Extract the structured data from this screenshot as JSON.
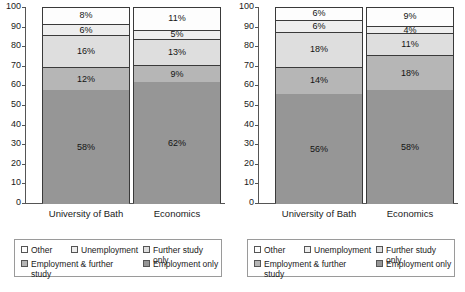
{
  "chart_data": [
    {
      "type": "bar",
      "subtype": "stacked-100-percent",
      "title": "",
      "xlabel": "",
      "ylabel": "",
      "ylim": [
        0,
        100
      ],
      "yticks": [
        0,
        10,
        20,
        30,
        40,
        50,
        60,
        70,
        80,
        90,
        100
      ],
      "grid": false,
      "legend_position": "bottom",
      "categories": [
        "University of Bath",
        "Economics"
      ],
      "series": [
        {
          "name": "Employment only",
          "values": [
            58,
            62
          ],
          "color": "#969696"
        },
        {
          "name": "Employment & further study",
          "values": [
            12,
            9
          ],
          "color": "#b6b6b6"
        },
        {
          "name": "Further study only",
          "values": [
            16,
            13
          ],
          "color": "#dedede"
        },
        {
          "name": "Unemployment",
          "values": [
            6,
            5
          ],
          "color": "#eeeeee"
        },
        {
          "name": "Other",
          "values": [
            8,
            11
          ],
          "color": "#fdfdfd"
        }
      ],
      "data_labels": [
        [
          "58%",
          "12%",
          "16%",
          "6%",
          "8%"
        ],
        [
          "62%",
          "9%",
          "13%",
          "5%",
          "11%"
        ]
      ]
    },
    {
      "type": "bar",
      "subtype": "stacked-100-percent",
      "title": "",
      "xlabel": "",
      "ylabel": "",
      "ylim": [
        0,
        100
      ],
      "yticks": [
        0,
        10,
        20,
        30,
        40,
        50,
        60,
        70,
        80,
        90,
        100
      ],
      "grid": false,
      "legend_position": "bottom",
      "categories": [
        "University of Bath",
        "Economics"
      ],
      "series": [
        {
          "name": "Employment only",
          "values": [
            56,
            58
          ],
          "color": "#969696"
        },
        {
          "name": "Employment & further study",
          "values": [
            14,
            18
          ],
          "color": "#b6b6b6"
        },
        {
          "name": "Further study only",
          "values": [
            18,
            11
          ],
          "color": "#dedede"
        },
        {
          "name": "Unemployment",
          "values": [
            6,
            4
          ],
          "color": "#eeeeee"
        },
        {
          "name": "Other",
          "values": [
            6,
            9
          ],
          "color": "#fdfdfd"
        }
      ],
      "data_labels": [
        [
          "56%",
          "14%",
          "18%",
          "6%",
          "6%"
        ],
        [
          "58%",
          "18%",
          "11%",
          "4%",
          "9%"
        ]
      ]
    }
  ],
  "panels": [
    {
      "id": "left-chart",
      "yticks": [
        "100",
        "90",
        "80",
        "70",
        "60",
        "50",
        "40",
        "30",
        "20",
        "10",
        "0"
      ],
      "bars": [
        {
          "label": "University of Bath",
          "segments": [
            {
              "key": "other",
              "label": "8%",
              "value": 8
            },
            {
              "key": "unemployment",
              "label": "6%",
              "value": 6
            },
            {
              "key": "further",
              "label": "16%",
              "value": 16
            },
            {
              "key": "empfurther",
              "label": "12%",
              "value": 12
            },
            {
              "key": "emponly",
              "label": "58%",
              "value": 58
            }
          ]
        },
        {
          "label": "Economics",
          "segments": [
            {
              "key": "other",
              "label": "11%",
              "value": 11
            },
            {
              "key": "unemployment",
              "label": "5%",
              "value": 5
            },
            {
              "key": "further",
              "label": "13%",
              "value": 13
            },
            {
              "key": "empfurther",
              "label": "9%",
              "value": 9
            },
            {
              "key": "emponly",
              "label": "62%",
              "value": 62
            }
          ]
        }
      ],
      "legend": [
        {
          "key": "other",
          "label": "Other"
        },
        {
          "key": "unemployment",
          "label": "Unemployment"
        },
        {
          "key": "further",
          "label": "Further study only"
        },
        {
          "key": "empfurther",
          "label": "Employment & further study"
        },
        {
          "key": "emponly",
          "label": "Employment only"
        }
      ]
    },
    {
      "id": "right-chart",
      "yticks": [
        "100",
        "90",
        "80",
        "70",
        "60",
        "50",
        "40",
        "30",
        "20",
        "10",
        "0"
      ],
      "bars": [
        {
          "label": "University of Bath",
          "segments": [
            {
              "key": "other",
              "label": "6%",
              "value": 6
            },
            {
              "key": "unemployment",
              "label": "6%",
              "value": 6
            },
            {
              "key": "further",
              "label": "18%",
              "value": 18
            },
            {
              "key": "empfurther",
              "label": "14%",
              "value": 14
            },
            {
              "key": "emponly",
              "label": "56%",
              "value": 56
            }
          ]
        },
        {
          "label": "Economics",
          "segments": [
            {
              "key": "other",
              "label": "9%",
              "value": 9
            },
            {
              "key": "unemployment",
              "label": "4%",
              "value": 4
            },
            {
              "key": "further",
              "label": "11%",
              "value": 11
            },
            {
              "key": "empfurther",
              "label": "18%",
              "value": 18
            },
            {
              "key": "emponly",
              "label": "58%",
              "value": 58
            }
          ]
        }
      ],
      "legend": [
        {
          "key": "other",
          "label": "Other"
        },
        {
          "key": "unemployment",
          "label": "Unemployment"
        },
        {
          "key": "further",
          "label": "Further study only"
        },
        {
          "key": "empfurther",
          "label": "Employment & further study"
        },
        {
          "key": "emponly",
          "label": "Employment only"
        }
      ]
    }
  ],
  "colors": {
    "other": "#fdfdfd",
    "unemployment": "#eeeeee",
    "further": "#dedede",
    "empfurther": "#b6b6b6",
    "emponly": "#969696",
    "axis": "#555555",
    "border": "#3a3a3a"
  }
}
